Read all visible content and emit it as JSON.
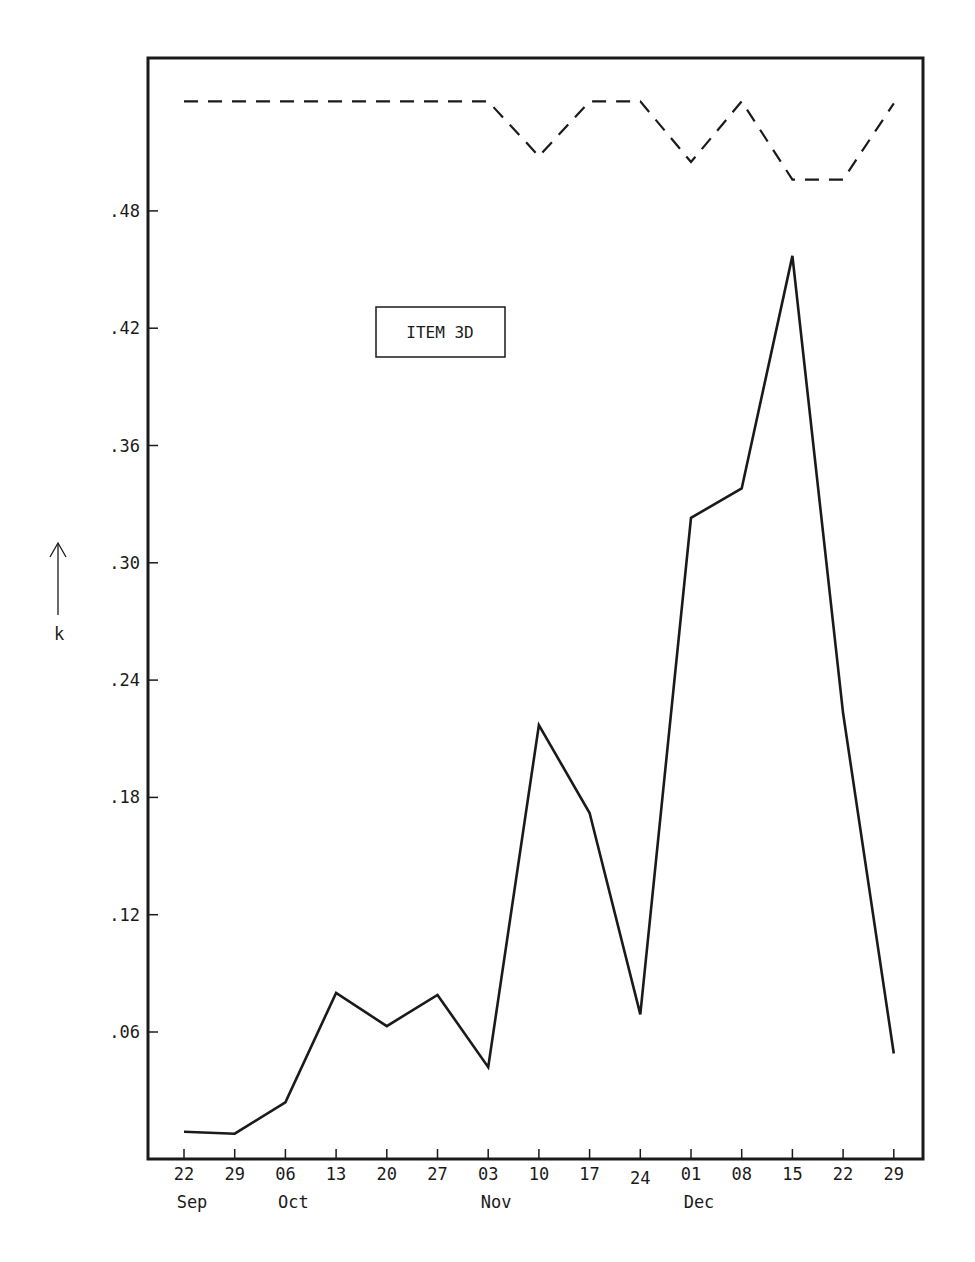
{
  "chart_data": {
    "type": "line",
    "title": "",
    "annotation": "ITEM  3D",
    "xlabel": "",
    "ylabel": "k",
    "ylabel_arrow": "up-arrow",
    "ylim": [
      0,
      0.54
    ],
    "yticks": [
      ".06",
      ".12",
      ".18",
      ".24",
      ".30",
      ".36",
      ".42",
      ".48"
    ],
    "ytick_values": [
      0.06,
      0.12,
      0.18,
      0.24,
      0.3,
      0.36,
      0.42,
      0.48
    ],
    "categories": [
      "22",
      "29",
      "06",
      "13",
      "20",
      "27",
      "03",
      "10",
      "17",
      "24",
      "01",
      "08",
      "15",
      "22",
      "29"
    ],
    "month_labels": [
      {
        "label": "Sep",
        "index": 0
      },
      {
        "label": "Oct",
        "index": 2
      },
      {
        "label": "Nov",
        "index": 6
      },
      {
        "label": "Dec",
        "index": 10
      }
    ],
    "grid": false,
    "legend": null,
    "series": [
      {
        "name": "k (solid)",
        "style": "solid",
        "values": [
          0.009,
          0.008,
          0.024,
          0.08,
          0.063,
          0.079,
          0.042,
          0.217,
          0.172,
          0.069,
          0.323,
          0.338,
          0.457,
          0.223,
          0.049
        ]
      },
      {
        "name": "reference (dashed)",
        "style": "dashed",
        "values": [
          0.536,
          0.536,
          0.536,
          0.536,
          0.536,
          0.536,
          0.536,
          0.508,
          0.536,
          0.536,
          0.505,
          0.536,
          0.496,
          0.496,
          0.535
        ]
      }
    ]
  },
  "colors": {
    "line": "#1a1a1a",
    "background": "#ffffff"
  }
}
